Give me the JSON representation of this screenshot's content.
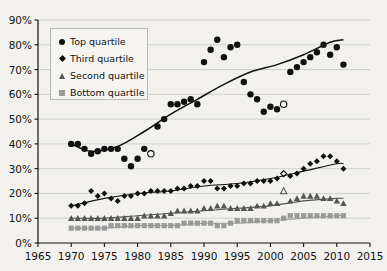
{
  "chart_data": {
    "type": "scatter",
    "title": "",
    "xlabel": "",
    "ylabel": "",
    "xlim": [
      1965,
      2015
    ],
    "ylim": [
      0,
      90
    ],
    "grid": true,
    "legend_position": "top-left",
    "x_ticks": [
      "1965",
      "1970",
      "1975",
      "1980",
      "1985",
      "1990",
      "1995",
      "2000",
      "2005",
      "2010",
      "2015"
    ],
    "y_ticks": [
      "0%",
      "10%",
      "20%",
      "30%",
      "40%",
      "50%",
      "60%",
      "70%",
      "80%",
      "90%"
    ],
    "series": [
      {
        "name": "Top quartile",
        "marker": "circle",
        "color": "#111111",
        "x": [
          1970,
          1971,
          1972,
          1973,
          1974,
          1975,
          1976,
          1977,
          1978,
          1979,
          1980,
          1981,
          1982,
          1983,
          1984,
          1985,
          1986,
          1987,
          1988,
          1989,
          1990,
          1991,
          1992,
          1993,
          1994,
          1995,
          1996,
          1997,
          1998,
          1999,
          2000,
          2001,
          2002,
          2003,
          2004,
          2005,
          2006,
          2007,
          2008,
          2009,
          2010,
          2011
        ],
        "values": [
          40,
          40,
          38,
          36,
          37,
          38,
          38,
          38,
          34,
          31,
          34,
          38,
          36,
          47,
          50,
          56,
          56,
          57,
          58,
          56,
          73,
          78,
          82,
          75,
          79,
          80,
          65,
          60,
          58,
          53,
          55,
          54,
          56,
          69,
          71,
          73,
          75,
          77,
          80,
          76,
          79,
          72
        ],
        "open_markers": [
          1982,
          2002
        ]
      },
      {
        "name": "Third quartile",
        "marker": "diamond",
        "color": "#111111",
        "x": [
          1970,
          1971,
          1972,
          1973,
          1974,
          1975,
          1976,
          1977,
          1978,
          1979,
          1980,
          1981,
          1982,
          1983,
          1984,
          1985,
          1986,
          1987,
          1988,
          1989,
          1990,
          1991,
          1992,
          1993,
          1994,
          1995,
          1996,
          1997,
          1998,
          1999,
          2000,
          2001,
          2002,
          2003,
          2004,
          2005,
          2006,
          2007,
          2008,
          2009,
          2010,
          2011
        ],
        "values": [
          15,
          15,
          16,
          21,
          19,
          20,
          18,
          17,
          19,
          19,
          20,
          20,
          21,
          21,
          21,
          21,
          22,
          22,
          23,
          23,
          25,
          25,
          22,
          22,
          23,
          23,
          24,
          24,
          25,
          25,
          25,
          26,
          28,
          27,
          28,
          30,
          32,
          33,
          35,
          35,
          33,
          30
        ],
        "open_markers": [
          2002
        ]
      },
      {
        "name": "Second quartile",
        "marker": "triangle",
        "color": "#555555",
        "x": [
          1970,
          1971,
          1972,
          1973,
          1974,
          1975,
          1976,
          1977,
          1978,
          1979,
          1980,
          1981,
          1982,
          1983,
          1984,
          1985,
          1986,
          1987,
          1988,
          1989,
          1990,
          1991,
          1992,
          1993,
          1994,
          1995,
          1996,
          1997,
          1998,
          1999,
          2000,
          2001,
          2002,
          2003,
          2004,
          2005,
          2006,
          2007,
          2008,
          2009,
          2010,
          2011
        ],
        "values": [
          10,
          10,
          10,
          10,
          10,
          10,
          10,
          10,
          10,
          10,
          10,
          11,
          11,
          11,
          11,
          12,
          13,
          13,
          13,
          13,
          14,
          14,
          15,
          15,
          14,
          14,
          14,
          14,
          15,
          15,
          16,
          16,
          21,
          17,
          18,
          19,
          19,
          19,
          18,
          18,
          17,
          16
        ],
        "open_markers": [
          2002
        ]
      },
      {
        "name": "Bottom quartile",
        "marker": "square",
        "color": "#9a9a9a",
        "x": [
          1970,
          1971,
          1972,
          1973,
          1974,
          1975,
          1976,
          1977,
          1978,
          1979,
          1980,
          1981,
          1982,
          1983,
          1984,
          1985,
          1986,
          1987,
          1988,
          1989,
          1990,
          1991,
          1992,
          1993,
          1994,
          1995,
          1996,
          1997,
          1998,
          1999,
          2000,
          2001,
          2002,
          2003,
          2004,
          2005,
          2006,
          2007,
          2008,
          2009,
          2010,
          2011
        ],
        "values": [
          6,
          6,
          6,
          6,
          6,
          6,
          7,
          7,
          7,
          7,
          7,
          7,
          7,
          7,
          7,
          7,
          7,
          8,
          8,
          8,
          8,
          8,
          7,
          7,
          8,
          9,
          9,
          9,
          9,
          9,
          9,
          9,
          10,
          11,
          11,
          11,
          11,
          11,
          11,
          11,
          11,
          11
        ],
        "open_markers": []
      }
    ],
    "trend_lines": [
      {
        "series": "Top quartile",
        "x": [
          1970,
          1973,
          1977,
          1981,
          1985,
          1989,
          1993,
          1997,
          2001,
          2005,
          2009,
          2011
        ],
        "values": [
          40,
          37,
          39,
          45,
          52,
          58,
          64,
          69,
          72,
          76,
          81,
          82
        ]
      },
      {
        "series": "Third quartile",
        "x": [
          1970,
          1975,
          1980,
          1985,
          1990,
          1995,
          2000,
          2005,
          2010,
          2011
        ],
        "values": [
          15,
          18,
          20,
          21,
          23,
          24,
          26,
          29,
          32,
          32
        ]
      },
      {
        "series": "Second quartile",
        "x": [
          1970,
          1975,
          1980,
          1985,
          1990,
          1995,
          2000,
          2005,
          2010,
          2011
        ],
        "values": [
          10,
          10,
          11,
          12,
          13,
          14,
          15,
          17,
          18,
          18
        ]
      },
      {
        "series": "Bottom quartile",
        "x": [
          1970,
          1975,
          1980,
          1985,
          1990,
          1995,
          2000,
          2005,
          2010,
          2011
        ],
        "values": [
          6,
          6,
          7,
          7,
          8,
          8,
          9,
          10,
          11,
          11
        ]
      }
    ]
  },
  "legend": {
    "items": [
      {
        "label": "Top quartile",
        "marker": "circle-icon"
      },
      {
        "label": "Third quartile",
        "marker": "diamond-icon"
      },
      {
        "label": "Second quartile",
        "marker": "triangle-icon"
      },
      {
        "label": "Bottom quartile",
        "marker": "square-icon"
      }
    ]
  },
  "colors": {
    "background": "#f2f1ee",
    "axis": "#111111",
    "grid": "#c8c8c4",
    "dark_marker": "#111111",
    "mid_marker": "#555555",
    "light_marker": "#9a9a9a"
  }
}
